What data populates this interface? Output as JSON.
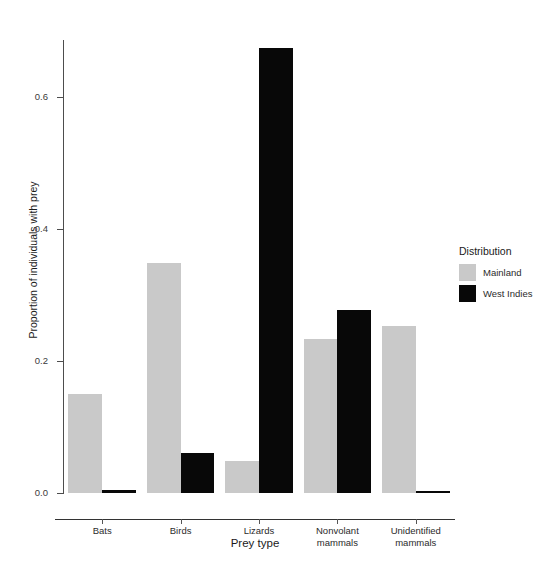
{
  "chart_data": {
    "type": "bar",
    "title": "",
    "subtitle": "",
    "xlabel": "Prey type",
    "ylabel": "Proportion of individuals with prey",
    "categories": [
      "Bats",
      "Birds",
      "Lizards",
      "Nonvolant mammals",
      "Unidentified mammals"
    ],
    "category_lines": [
      [
        "Bats"
      ],
      [
        "Birds"
      ],
      [
        "Lizards"
      ],
      [
        "Nonvolant",
        "mammals"
      ],
      [
        "Unidentified",
        "mammals"
      ]
    ],
    "series": [
      {
        "name": "Mainland",
        "color": "#c9c9c9",
        "values": [
          0.15,
          0.348,
          0.048,
          0.233,
          0.253
        ]
      },
      {
        "name": "West Indies",
        "color": "#080808",
        "values": [
          0.005,
          0.06,
          0.675,
          0.277,
          0.003
        ]
      }
    ],
    "ylim": [
      0.0,
      0.69
    ],
    "xlim_note": "categorical",
    "yticks": [
      0.0,
      0.2,
      0.4,
      0.6
    ],
    "ytick_labels": [
      "0.0",
      "0.2",
      "0.4",
      "0.6"
    ],
    "grid": false,
    "legend": {
      "title": "Distribution",
      "position": "right",
      "entries": [
        {
          "label": "Mainland",
          "color": "#c9c9c9",
          "swatch": "mainland-swatch"
        },
        {
          "label": "West Indies",
          "color": "#080808",
          "swatch": "west-indies-swatch"
        }
      ]
    },
    "axis_color": "#4d4d4d",
    "background": "#ffffff"
  }
}
